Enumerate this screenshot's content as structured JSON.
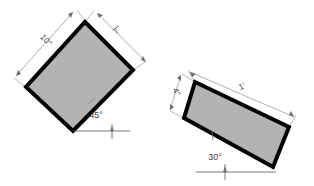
{
  "figure": {
    "background_color": "#ffffff",
    "shape_fill_color": "#b3b3b3",
    "shape_outline_color": "#000000",
    "dimension_line_color": "#8c8c8c",
    "label_text_color": "#4a4a4a",
    "shapes": [
      {
        "id": "left-rectangle",
        "name": "left-rectangle",
        "rotation_degrees": 45,
        "dimensions": {
          "long_side_label": "10\"",
          "short_side_label": "7\""
        },
        "angle_label": "45°",
        "angle_value": 45,
        "angle_unit": "degrees"
      },
      {
        "id": "right-rectangle",
        "name": "right-rectangle",
        "rotation_degrees": 30,
        "dimensions": {
          "long_side_label": "1'",
          "short_side_label": "4\""
        },
        "angle_label": "30°",
        "angle_value": 30,
        "angle_unit": "degrees"
      }
    ],
    "labels": {
      "left_long_side": "10\"",
      "left_short_side": "7\"",
      "left_angle": "45°",
      "right_long_side": "1'",
      "right_short_side": "4\"",
      "right_angle": "30°"
    }
  }
}
